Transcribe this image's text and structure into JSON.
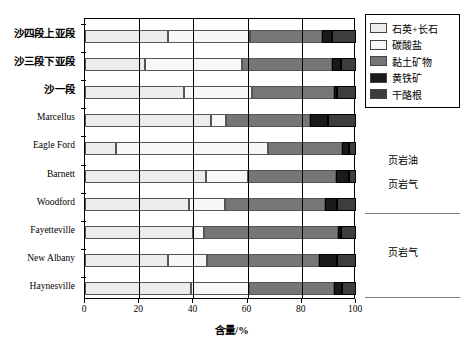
{
  "chart_data": {
    "type": "bar",
    "orientation": "horizontal",
    "stacked": true,
    "title": "",
    "xlabel": "含量/%",
    "ylabel": "",
    "xlim": [
      0,
      100
    ],
    "xticks": [
      0,
      20,
      40,
      60,
      80,
      100
    ],
    "xtick_labels": [
      "0",
      "20",
      "40",
      "60",
      "80",
      "100"
    ],
    "grid": "vertical",
    "legend_position": "top-right-outside",
    "categories": [
      "沙四段上亚段",
      "沙三段下亚段",
      "沙一段",
      "Marcellus",
      "Eagle Ford",
      "Barnett",
      "Woodford",
      "Fayetteville",
      "New Albany",
      "Haynesville"
    ],
    "series": [
      {
        "name": "石英+长石",
        "color": "#ececec",
        "values": [
          30.5,
          22.0,
          36.5,
          46.5,
          11.5,
          44.5,
          38.5,
          40.0,
          30.5,
          39.0
        ]
      },
      {
        "name": "碳酸盐",
        "color": "#f7f7f7",
        "values": [
          30.5,
          36.0,
          25.0,
          5.5,
          56.0,
          15.5,
          13.0,
          4.0,
          14.5,
          21.5
        ]
      },
      {
        "name": "黏土矿物",
        "color": "#767676",
        "values": [
          26.5,
          33.0,
          30.5,
          31.0,
          27.5,
          32.5,
          37.0,
          49.5,
          41.5,
          31.5
        ]
      },
      {
        "name": "黄铁矿",
        "color": "#1a1a1a",
        "values": [
          3.5,
          3.5,
          1.0,
          6.5,
          2.5,
          5.0,
          4.5,
          1.0,
          6.5,
          3.0
        ]
      },
      {
        "name": "干酪根",
        "color": "#3d3d3d",
        "values": [
          9.0,
          5.5,
          7.0,
          10.5,
          2.5,
          2.5,
          7.0,
          5.5,
          7.0,
          5.0
        ]
      }
    ]
  },
  "legend": {
    "items": [
      {
        "label": "石英+长石",
        "color": "#ececec",
        "icon": "legend-swatch-quartz-feldspar"
      },
      {
        "label": "碳酸盐",
        "color": "#f7f7f7",
        "icon": "legend-swatch-carbonate"
      },
      {
        "label": "黏土矿物",
        "color": "#767676",
        "icon": "legend-swatch-clay"
      },
      {
        "label": "黄铁矿",
        "color": "#1a1a1a",
        "icon": "legend-swatch-pyrite"
      },
      {
        "label": "干酪根",
        "color": "#3d3d3d",
        "icon": "legend-swatch-kerogen"
      }
    ]
  },
  "annotations": [
    {
      "text": "页岩油",
      "top": 152
    },
    {
      "text": "页岩气",
      "top": 176
    },
    {
      "text": "页岩气",
      "top": 244
    }
  ],
  "axis": {
    "x_title": "含量/%",
    "x_tick_labels": [
      "0",
      "20",
      "40",
      "60",
      "80",
      "100"
    ]
  }
}
